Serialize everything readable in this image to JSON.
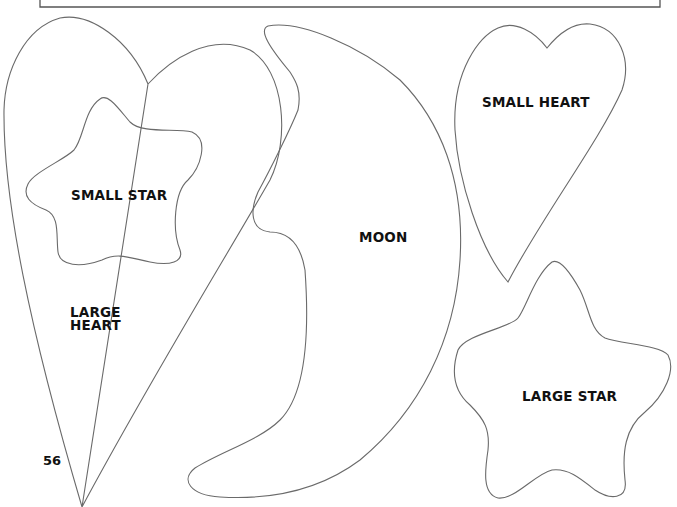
{
  "page": {
    "page_number": "56"
  },
  "shapes": {
    "large_heart": {
      "label_line1": "LARGE",
      "label_line2": "HEART"
    },
    "small_star": {
      "label": "SMALL STAR"
    },
    "moon": {
      "label": "MOON"
    },
    "small_heart": {
      "label": "SMALL HEART"
    },
    "large_star": {
      "label": "LARGE STAR"
    }
  },
  "colors": {
    "outline": "#6a6a6a",
    "text": "#111111",
    "background": "#ffffff"
  }
}
